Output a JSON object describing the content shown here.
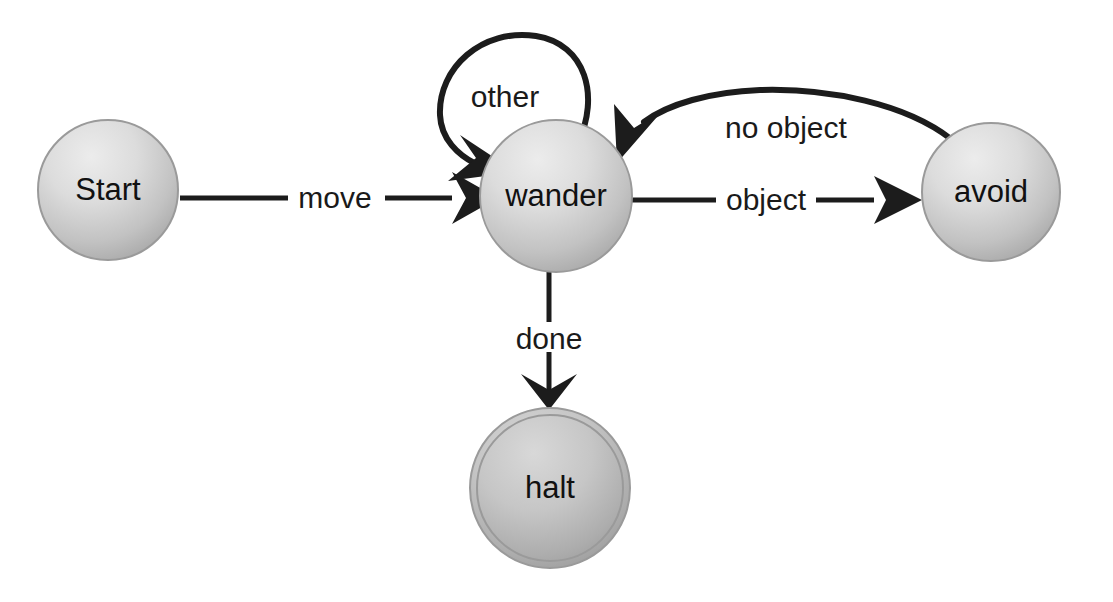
{
  "diagram": {
    "type": "state-transition-diagram",
    "background_color": "#ffffff",
    "edge_color": "#1c1c1c",
    "node_fill_light": "#e9e9e9",
    "node_fill_mid": "#bdbdbd",
    "node_fill_dark": "#a7a7a7",
    "node_fill_halt_light": "#d2d2d2",
    "node_fill_halt_dark": "#9a9a9a",
    "node_stroke": "#9a9a9a",
    "label_color": "#111111"
  },
  "nodes": [
    {
      "id": "start",
      "label": "Start",
      "cx": 108,
      "cy": 190,
      "r": 70,
      "kind": "initial",
      "double_ring": false
    },
    {
      "id": "wander",
      "label": "wander",
      "cx": 556,
      "cy": 196,
      "r": 76,
      "kind": "state",
      "double_ring": false
    },
    {
      "id": "avoid",
      "label": "avoid",
      "cx": 991,
      "cy": 192,
      "r": 69,
      "kind": "state",
      "double_ring": false
    },
    {
      "id": "halt",
      "label": "halt",
      "cx": 550,
      "cy": 488,
      "r": 80,
      "kind": "final",
      "double_ring": true
    }
  ],
  "edges": [
    {
      "id": "start-to-wander",
      "label": "move",
      "from": "start",
      "to": "wander",
      "style": "straight",
      "label_x": 335,
      "label_y": 198
    },
    {
      "id": "wander-self-loop",
      "label": "other",
      "from": "wander",
      "to": "wander",
      "style": "self-loop",
      "label_x": 505,
      "label_y": 97
    },
    {
      "id": "wander-to-avoid",
      "label": "object",
      "from": "wander",
      "to": "avoid",
      "style": "straight",
      "label_x": 766,
      "label_y": 200
    },
    {
      "id": "avoid-to-wander",
      "label": "no object",
      "from": "avoid",
      "to": "wander",
      "style": "curved",
      "label_x": 786,
      "label_y": 128
    },
    {
      "id": "wander-to-halt",
      "label": "done",
      "from": "wander",
      "to": "halt",
      "style": "straight",
      "label_x": 549,
      "label_y": 339
    }
  ]
}
